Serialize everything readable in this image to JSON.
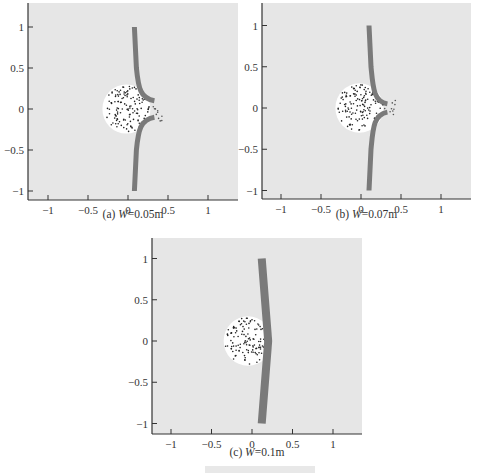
{
  "figure_caption_partial": "...",
  "chart_data": [
    {
      "type": "scatter",
      "panel": "a",
      "caption": "(a)  W=0.05m",
      "caption_label": "(a)",
      "caption_var": "W",
      "caption_value": "=0.05m",
      "xlim": [
        -1.2,
        1.35
      ],
      "ylim": [
        -1.1,
        1.3
      ],
      "xticks": [
        "-1",
        "-0.5",
        "0",
        "0.5",
        "1"
      ],
      "yticks": [
        "1",
        "0.5",
        "0",
        "-0.5",
        "-1"
      ],
      "background": "#e6e6e6",
      "wall_color": "#7a7a7a",
      "description": "Dotted circular cluster (centered ~x=-0.02, radius ~0.3) with a gray wall at x~0.08 from y=1 to y=-1 that bends outward to ~x=0.35 near y=0 with a gap",
      "cluster": {
        "cx": -0.02,
        "cy": 0.0,
        "r": 0.3
      },
      "wall": {
        "x_top": 0.08,
        "x_bend": 0.33,
        "gap": [
          -0.1,
          0.1
        ]
      }
    },
    {
      "type": "scatter",
      "panel": "b",
      "caption": "(b)  W=0.07m",
      "caption_label": "(b)",
      "caption_var": "W",
      "caption_value": "=0.07m",
      "xlim": [
        -1.2,
        1.35
      ],
      "ylim": [
        -1.1,
        1.3
      ],
      "xticks": [
        "-1",
        "-0.5",
        "0",
        "0.5",
        "1"
      ],
      "yticks": [
        "1",
        "0.5",
        "0",
        "-0.5",
        "-1"
      ],
      "background": "#e6e6e6",
      "wall_color": "#7a7a7a",
      "cluster": {
        "cx": -0.02,
        "cy": 0.0,
        "r": 0.3
      },
      "wall": {
        "x_top": 0.1,
        "x_bend": 0.33,
        "gap": [
          -0.05,
          0.05
        ]
      }
    },
    {
      "type": "scatter",
      "panel": "c",
      "caption": "(c)  W=0.1m",
      "caption_label": "(c)",
      "caption_var": "W",
      "caption_value": "=0.1m",
      "xlim": [
        -1.2,
        1.35
      ],
      "ylim": [
        -1.1,
        1.3
      ],
      "xticks": [
        "-1",
        "-0.5",
        "0",
        "0.5",
        "1"
      ],
      "yticks": [
        "1",
        "0.5",
        "0",
        "-0.5",
        "-1"
      ],
      "background": "#e6e6e6",
      "wall_color": "#7a7a7a",
      "cluster": {
        "cx": -0.05,
        "cy": 0.0,
        "r": 0.3
      },
      "wall": {
        "x_top": 0.12,
        "x_bend": 0.2,
        "gap": null
      }
    }
  ]
}
